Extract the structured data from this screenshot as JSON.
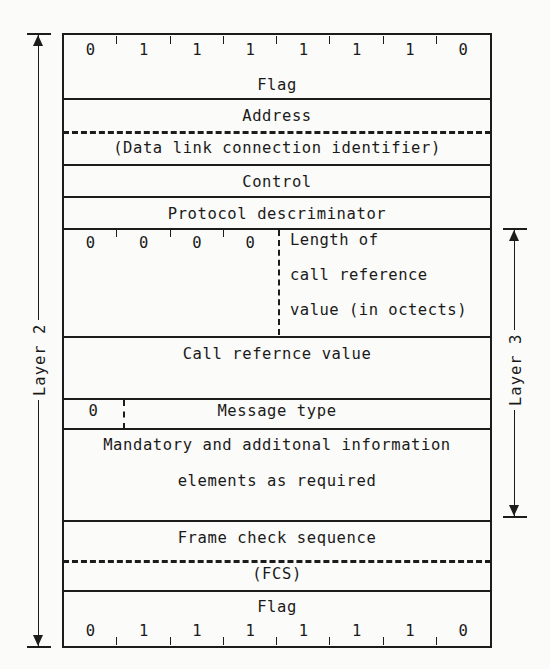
{
  "diagram": {
    "left_bracket_label": "Layer 2",
    "right_bracket_label": "Layer 3",
    "ink_color": "#1c1c1c",
    "paper_color": "#fbfbf9"
  },
  "bits": {
    "top_flag": [
      "0",
      "1",
      "1",
      "1",
      "1",
      "1",
      "1",
      "0"
    ],
    "bottom_flag": [
      "0",
      "1",
      "1",
      "1",
      "1",
      "1",
      "1",
      "0"
    ],
    "nibble": [
      "0",
      "0",
      "0",
      "0"
    ],
    "message_type_prefix": "0"
  },
  "rows": [
    {
      "name": "flag-top",
      "label": "Flag"
    },
    {
      "name": "address",
      "label": "Address"
    },
    {
      "name": "dlci",
      "label": "(Data link connection identifier)"
    },
    {
      "name": "control",
      "label": "Control"
    },
    {
      "name": "protocol-discriminator",
      "label": "Protocol descriminator"
    },
    {
      "name": "call-reference-length",
      "lines": [
        "Length of",
        "call reference",
        "value (in octects)"
      ]
    },
    {
      "name": "call-reference-value",
      "label": "Call refernce value"
    },
    {
      "name": "message-type",
      "label": "Message    type"
    },
    {
      "name": "information-elements",
      "lines": [
        "Mandatory and additonal information",
        "elements as required"
      ]
    },
    {
      "name": "frame-check-sequence",
      "label": "Frame check sequence"
    },
    {
      "name": "fcs-abbrev",
      "label": "(FCS)"
    },
    {
      "name": "flag-bottom",
      "label": "Flag"
    }
  ]
}
